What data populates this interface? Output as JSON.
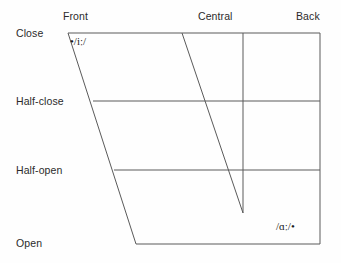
{
  "diagram": {
    "axes": {
      "backness": {
        "name": "backness",
        "labels": [
          {
            "key": "front",
            "text": "Front"
          },
          {
            "key": "central",
            "text": "Central"
          },
          {
            "key": "back",
            "text": "Back"
          }
        ]
      },
      "height": {
        "name": "height",
        "labels": [
          {
            "key": "close",
            "text": "Close"
          },
          {
            "key": "half-close",
            "text": "Half-close"
          },
          {
            "key": "half-open",
            "text": "Half-open"
          },
          {
            "key": "open",
            "text": "Open"
          }
        ]
      }
    },
    "vowels": [
      {
        "key": "fleece",
        "symbol": "•/iː/",
        "height": "close",
        "backness": "front"
      },
      {
        "key": "palm",
        "symbol": "/ɑː/•",
        "height": "open",
        "backness": "back"
      }
    ],
    "colors": {
      "stroke": "#5a5a5a",
      "text": "#2b2b2b",
      "symbol": "#1a1a1a",
      "background": "#fefefe"
    },
    "geometry": {
      "trapezoid": {
        "top_left": [
          68,
          33
        ],
        "top_right": [
          320,
          33
        ],
        "bottom_right": [
          320,
          244
        ],
        "bottom_left": [
          136,
          244
        ]
      },
      "height_lines": [
        {
          "key": "close",
          "x1": 68,
          "y1": 33,
          "x2": 320,
          "y2": 33
        },
        {
          "key": "half-close",
          "x1": 93,
          "y1": 101,
          "x2": 320,
          "y2": 101
        },
        {
          "key": "half-open",
          "x1": 114,
          "y1": 170,
          "x2": 320,
          "y2": 170
        },
        {
          "key": "open",
          "x1": 136,
          "y1": 244,
          "x2": 320,
          "y2": 244
        }
      ],
      "backness_lines": [
        {
          "key": "front-central-divider",
          "x1": 182,
          "y1": 33,
          "x2": 243,
          "y2": 213
        },
        {
          "key": "central-back-divider",
          "x1": 243,
          "y1": 33,
          "x2": 243,
          "y2": 213
        }
      ]
    }
  }
}
